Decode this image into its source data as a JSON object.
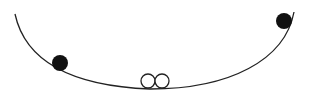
{
  "diagram": {
    "description": "Curved track (U-shaped valley) with two filled balls on the slopes and two open circles resting at the bottom",
    "colors": {
      "background": "#ffffff",
      "track": "#222222",
      "filled_ball": "#111111",
      "open_circle_stroke": "#222222"
    },
    "track": {
      "path": "M15,14 C25,60 70,86 150,89 C230,89 285,60 294,12",
      "stroke_width": 1.3
    },
    "balls": [
      {
        "name": "left-ball",
        "cx": 60,
        "cy": 63,
        "r": 8,
        "filled": true
      },
      {
        "name": "right-ball",
        "cx": 284,
        "cy": 21,
        "r": 8,
        "filled": true
      },
      {
        "name": "bottom-circle-left",
        "cx": 148,
        "cy": 81,
        "r": 7,
        "filled": false
      },
      {
        "name": "bottom-circle-right",
        "cx": 162,
        "cy": 81,
        "r": 7,
        "filled": false
      }
    ]
  }
}
